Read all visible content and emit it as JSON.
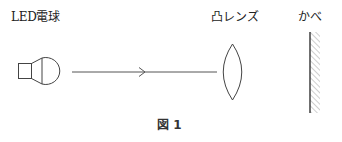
{
  "labels": {
    "light_source": "LED電球",
    "lens": "凸レンズ",
    "wall": "かべ"
  },
  "caption": "図 1",
  "colors": {
    "stroke": "#444444",
    "text": "#222222",
    "background": "#ffffff"
  }
}
